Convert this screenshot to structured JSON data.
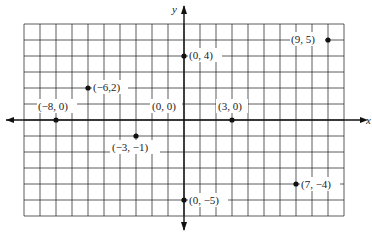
{
  "diagram": {
    "type": "coordinate-plane",
    "x_axis_label": "x",
    "y_axis_label": "y",
    "grid": {
      "x_min": -10,
      "x_max": 10,
      "y_min": -6,
      "y_max": 6
    },
    "points": [
      {
        "x": 0,
        "y": 4,
        "label": "(0, 4)"
      },
      {
        "x": 9,
        "y": 5,
        "label": "(9, 5)"
      },
      {
        "x": -6,
        "y": 2,
        "label": "(−6,2)"
      },
      {
        "x": -8,
        "y": 0,
        "label": "(−8, 0)"
      },
      {
        "x": 0,
        "y": 0,
        "label": "(0, 0)"
      },
      {
        "x": 3,
        "y": 0,
        "label": "(3, 0)"
      },
      {
        "x": -3,
        "y": -1,
        "label": "(−3, −1)"
      },
      {
        "x": 0,
        "y": -5,
        "label": "(0, −5)"
      },
      {
        "x": 7,
        "y": -4,
        "label": "(7, −4)"
      }
    ]
  }
}
